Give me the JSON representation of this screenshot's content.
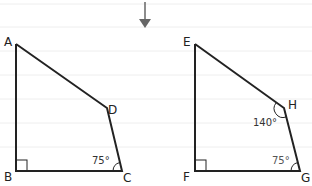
{
  "figure_left": {
    "vertices": {
      "A": "A",
      "B": "B",
      "C": "C",
      "D": "D"
    },
    "angle_C": "75°",
    "right_angle_at": "B"
  },
  "figure_right": {
    "vertices": {
      "E": "E",
      "F": "F",
      "G": "G",
      "H": "H"
    },
    "angle_H": "140°",
    "angle_G": "75°",
    "right_angle_at": "F"
  },
  "arrow": "down-arrow"
}
